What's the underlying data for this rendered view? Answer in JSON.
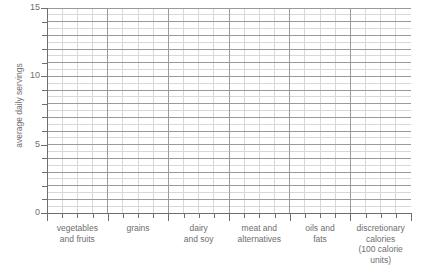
{
  "chart_data": {
    "type": "bar",
    "title": "",
    "subtitle": "",
    "xlabel": "",
    "ylabel": "average daily servings",
    "ylim": [
      0,
      15
    ],
    "ytick_interval": 1,
    "ytick_labels": [
      "0",
      "5",
      "10",
      "15"
    ],
    "ytick_label_values": [
      0,
      5,
      10,
      15
    ],
    "ytick_values": [
      0,
      1,
      2,
      3,
      4,
      5,
      6,
      7,
      8,
      9,
      10,
      11,
      12,
      13,
      14,
      15
    ],
    "grid": "major and minor gridlines; major at each whole serving, minor at half servings vertically and at quarter-category divisions horizontally",
    "grid_major_color": "#9a9a9a",
    "grid_minor_color": "#d8d8d8",
    "axis_color": "#6e6e6e",
    "legend": "none",
    "legend_position": "none",
    "categories": [
      "vegetables and fruits",
      "grains",
      "dairy and soy",
      "meat and alternatives",
      "oils and fats",
      "discretionary calories (100 calorie units)"
    ],
    "category_label_lines": [
      [
        "vegetables",
        "and fruits"
      ],
      [
        "grains"
      ],
      [
        "dairy",
        "and soy"
      ],
      [
        "meat and",
        "alternatives"
      ],
      [
        "oils and",
        "fats"
      ],
      [
        "discretionary",
        "calories",
        "(100 calorie",
        "units)"
      ]
    ],
    "series": [
      {
        "name": "average daily servings",
        "values": [
          null,
          null,
          null,
          null,
          null,
          null
        ]
      }
    ],
    "values": [
      null,
      null,
      null,
      null,
      null,
      null
    ]
  },
  "axes": {
    "y": {
      "title": "average daily servings",
      "labels": [
        {
          "value": 15,
          "text": "15"
        },
        {
          "value": 10,
          "text": "10"
        },
        {
          "value": 5,
          "text": "5"
        },
        {
          "value": 0,
          "text": "0"
        }
      ]
    },
    "x": {
      "categories": [
        {
          "lines": [
            "vegetables",
            "and fruits"
          ]
        },
        {
          "lines": [
            "grains"
          ]
        },
        {
          "lines": [
            "dairy",
            "and soy"
          ]
        },
        {
          "lines": [
            "meat and",
            "alternatives"
          ]
        },
        {
          "lines": [
            "oils and",
            "fats"
          ]
        },
        {
          "lines": [
            "discretionary",
            "calories",
            "(100 calorie",
            "units)"
          ]
        }
      ]
    }
  },
  "colors": {
    "background": "#ffffff",
    "axis": "#6e6e6e",
    "grid_major": "#9a9a9a",
    "grid_minor": "#d8d8d8",
    "text": "#6e6e6e"
  }
}
